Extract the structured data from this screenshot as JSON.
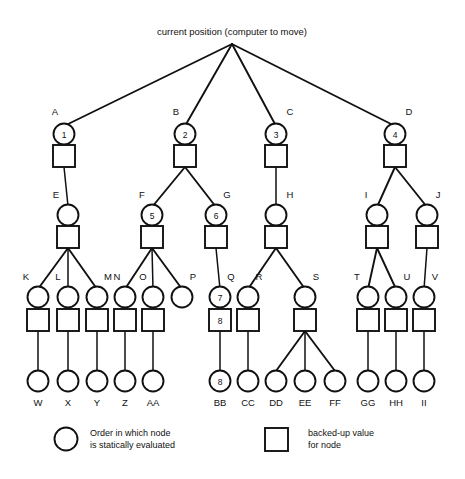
{
  "figure": {
    "title": "current position (computer to move)",
    "background_color": "#ffffff",
    "stroke_color": "#111111"
  },
  "legend": {
    "circle": {
      "icon": "circle-icon",
      "line1": "Order in which node",
      "line2": "is statically evaluated"
    },
    "square": {
      "icon": "square-icon",
      "line1": "backed-up value",
      "line2": "for node"
    }
  },
  "tree": {
    "root": {
      "name": "root",
      "x": 232,
      "y": 44
    },
    "level1": [
      {
        "label": "A",
        "x": 64,
        "circle_value": "1",
        "square_value": ""
      },
      {
        "label": "B",
        "x": 185,
        "circle_value": "2",
        "square_value": ""
      },
      {
        "label": "C",
        "x": 276,
        "circle_value": "3",
        "square_value": ""
      },
      {
        "label": "D",
        "x": 395,
        "circle_value": "4",
        "square_value": ""
      }
    ],
    "level2": [
      {
        "label": "E",
        "x": 68,
        "parent": "A",
        "circle_value": "",
        "square_value": ""
      },
      {
        "label": "F",
        "x": 152,
        "parent": "B",
        "circle_value": "5",
        "square_value": ""
      },
      {
        "label": "G",
        "x": 216,
        "parent": "B",
        "circle_value": "6",
        "square_value": ""
      },
      {
        "label": "H",
        "x": 276,
        "parent": "C",
        "circle_value": "",
        "square_value": ""
      },
      {
        "label": "I",
        "x": 377,
        "parent": "D",
        "circle_value": "",
        "square_value": ""
      },
      {
        "label": "J",
        "x": 427,
        "parent": "D",
        "circle_value": "",
        "square_value": ""
      }
    ],
    "level3": [
      {
        "label": "K",
        "x": 38,
        "parent": "E",
        "circle_value": "",
        "square_value": "",
        "has_square": true
      },
      {
        "label": "L",
        "x": 68,
        "parent": "E",
        "circle_value": "",
        "square_value": "",
        "has_square": true
      },
      {
        "label": "M",
        "x": 97,
        "parent": "E",
        "circle_value": "",
        "square_value": "",
        "has_square": true
      },
      {
        "label": "N",
        "x": 125,
        "parent": "F",
        "circle_value": "",
        "square_value": "",
        "has_square": true
      },
      {
        "label": "O",
        "x": 153,
        "parent": "F",
        "circle_value": "",
        "square_value": "",
        "has_square": true
      },
      {
        "label": "P",
        "x": 182,
        "parent": "F",
        "circle_value": "",
        "square_value": "",
        "has_square": false
      },
      {
        "label": "Q",
        "x": 220,
        "parent": "G",
        "circle_value": "7",
        "square_value": "8",
        "has_square": true
      },
      {
        "label": "R",
        "x": 248,
        "parent": "H",
        "circle_value": "",
        "square_value": "",
        "has_square": true
      },
      {
        "label": "S",
        "x": 305,
        "parent": "H",
        "circle_value": "",
        "square_value": "",
        "has_square": true
      },
      {
        "label": "T",
        "x": 368,
        "parent": "I",
        "circle_value": "",
        "square_value": "",
        "has_square": true
      },
      {
        "label": "U",
        "x": 396,
        "parent": "I",
        "circle_value": "",
        "square_value": "",
        "has_square": true
      },
      {
        "label": "V",
        "x": 424,
        "parent": "J",
        "circle_value": "",
        "square_value": "",
        "has_square": true
      }
    ],
    "leaves": [
      {
        "label": "W",
        "x": 38,
        "parent": "K",
        "value": ""
      },
      {
        "label": "X",
        "x": 68,
        "parent": "L",
        "value": ""
      },
      {
        "label": "Y",
        "x": 97,
        "parent": "M",
        "value": ""
      },
      {
        "label": "Z",
        "x": 125,
        "parent": "N",
        "value": ""
      },
      {
        "label": "AA",
        "x": 153,
        "parent": "O",
        "value": ""
      },
      {
        "label": "BB",
        "x": 220,
        "parent": "Q",
        "value": "8"
      },
      {
        "label": "CC",
        "x": 248,
        "parent": "R",
        "value": ""
      },
      {
        "label": "DD",
        "x": 276,
        "parent": "S",
        "value": ""
      },
      {
        "label": "EE",
        "x": 305,
        "parent": "S",
        "value": ""
      },
      {
        "label": "FF",
        "x": 335,
        "parent": "S",
        "value": ""
      },
      {
        "label": "GG",
        "x": 368,
        "parent": "T",
        "value": ""
      },
      {
        "label": "HH",
        "x": 396,
        "parent": "U",
        "value": ""
      },
      {
        "label": "II",
        "x": 424,
        "parent": "V",
        "value": ""
      }
    ]
  },
  "geometry": {
    "root_y": 44,
    "l1_circle_y": 134,
    "l1_square_y": 156,
    "l2_circle_y": 215,
    "l2_square_y": 237,
    "l3_circle_y": 297,
    "l3_square_y": 320,
    "leaf_y": 381,
    "circle_r": 10.5,
    "square_size": 22
  }
}
